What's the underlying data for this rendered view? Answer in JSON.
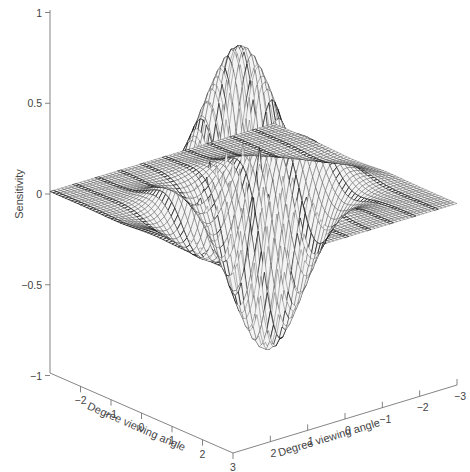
{
  "chart_data": {
    "type": "surface",
    "title": "",
    "zlabel": "Sensitivity",
    "xlabel": "Degree viewing angle",
    "ylabel": "Degree viewing angle",
    "zlim": [
      -1,
      1
    ],
    "xlim": [
      -3,
      3
    ],
    "ylim": [
      -3,
      3
    ],
    "z_ticks": [
      {
        "value": 1,
        "label": "1"
      },
      {
        "value": 0.5,
        "label": "0.5"
      },
      {
        "value": 0,
        "label": "0"
      },
      {
        "value": -0.5,
        "label": "-0.5"
      },
      {
        "value": -1,
        "label": "-1"
      }
    ],
    "x_ticks": [
      {
        "value": -2,
        "label": "−2"
      },
      {
        "value": -1,
        "label": "−1"
      },
      {
        "value": 0,
        "label": "0"
      },
      {
        "value": 1,
        "label": "1"
      },
      {
        "value": 2,
        "label": "2"
      },
      {
        "value": 3,
        "label": "3"
      }
    ],
    "y_ticks": [
      {
        "value": 2,
        "label": "2"
      },
      {
        "value": 1,
        "label": "1"
      },
      {
        "value": 0,
        "label": "0"
      },
      {
        "value": -1,
        "label": "−1"
      },
      {
        "value": -2,
        "label": "−2"
      },
      {
        "value": -3,
        "label": "−3"
      }
    ],
    "surface": {
      "description": "Odd-symmetric Gabor-like receptive field sensitivity profile (wireframe mesh)",
      "grid_n": 61,
      "peaks": [
        {
          "label": "main positive lobe",
          "z": 0.88
        },
        {
          "label": "secondary positive lobe",
          "z": 0.47
        },
        {
          "label": "main negative lobe",
          "z": -0.9
        },
        {
          "label": "secondary negative lobe",
          "z": -0.5
        }
      ],
      "params": {
        "sigma_x": 0.75,
        "sigma_y": 1.0,
        "freq": 0.42,
        "phase": 1.5708,
        "amp": 1.0
      }
    },
    "colors": {
      "mesh": "#1a1a1a",
      "fill": "#ffffff",
      "axis": "#555555"
    }
  }
}
